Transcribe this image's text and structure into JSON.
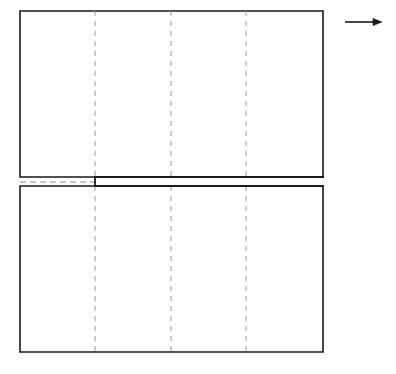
{
  "figure": {
    "background_color": "#ffffff",
    "stroke_color": "#1a1a1a",
    "dashed_color": "#9a9a9a",
    "centerline_color": "#8c8c8c",
    "width": 396,
    "height": 374
  },
  "plate": {
    "name": "specimen-outline",
    "left": 20,
    "right": 323,
    "top": 11,
    "bottom": 352,
    "width": 303,
    "height": 341,
    "stroke_width": 1.6
  },
  "upper_half": {
    "name": "upper-plate-half",
    "top": 11,
    "bottom": 177,
    "left": 20,
    "right": 323
  },
  "lower_half": {
    "name": "lower-plate-half",
    "top": 186,
    "bottom": 352,
    "left": 20,
    "right": 323
  },
  "crack": {
    "name": "crack-slot",
    "label": "crack",
    "tip_x": 95,
    "end_x": 323,
    "upper_edge_y": 177,
    "lower_edge_y": 186,
    "opening": 9,
    "length": 228,
    "stroke_width": 1.8
  },
  "centerline": {
    "name": "horizontal-centerline",
    "y": 182,
    "x_start": 20,
    "x_end": 95,
    "dash_pattern": "6 4",
    "stroke_width": 1
  },
  "reference_lines": {
    "label": "dashed vertical reference lines",
    "dash_pattern": "5 5",
    "stroke_width": 1,
    "items": [
      {
        "name": "reference-line-1",
        "x": 95
      },
      {
        "name": "reference-line-2",
        "x": 171
      },
      {
        "name": "reference-line-3",
        "x": 246
      }
    ]
  },
  "load_arrow": {
    "name": "load-direction-arrow",
    "label": "load direction",
    "x_start": 345,
    "x_end": 382,
    "y": 22,
    "shaft_width": 1.6,
    "head_length": 9,
    "head_half_height": 3.6
  },
  "chart_data": {
    "type": "diagram",
    "elements": [
      "specimen-outline",
      "crack-slot",
      "horizontal-centerline",
      "reference-line-1",
      "reference-line-2",
      "reference-line-3",
      "load-direction-arrow"
    ]
  }
}
